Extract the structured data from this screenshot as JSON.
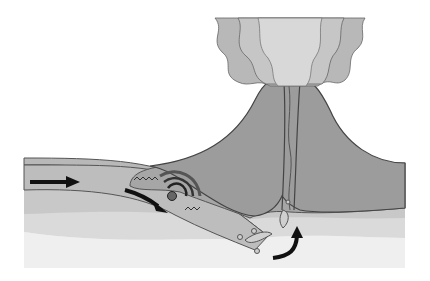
{
  "diagram": {
    "labels": [],
    "colors": {
      "background": "#ffffff",
      "mantle_light": "#ececec",
      "mantle_mid": "#d8d8d8",
      "lower_band": "#c6c6c6",
      "oceanic_plate": "#b5b5b5",
      "continental_crust": "#a2a2a2",
      "volcano": "#999999",
      "plume_outer": "#b8b8b8",
      "plume_mid": "#c6c6c6",
      "plume_inner": "#d6d6d6",
      "outline": "#555555",
      "arrow": "#111111",
      "quake_focus": "#666666"
    },
    "elements": [
      {
        "id": "plate-motion-arrow",
        "description": "straight arrow pointing right on oceanic plate"
      },
      {
        "id": "subduction-arrow",
        "description": "arrow pointing down along subducting slab"
      },
      {
        "id": "earthquake-focus",
        "description": "circle with concentric seismic wave arcs"
      },
      {
        "id": "fault-zigzag",
        "description": "wavy lines at plate interface"
      },
      {
        "id": "magma-blobs",
        "description": "rising magma pockets beneath volcano"
      },
      {
        "id": "magma-rise-arrow",
        "description": "curved arrow pointing upward"
      },
      {
        "id": "volcano",
        "description": "volcanic cone with central conduit"
      },
      {
        "id": "ash-plume",
        "description": "wavy eruption cloud above crater"
      }
    ]
  }
}
